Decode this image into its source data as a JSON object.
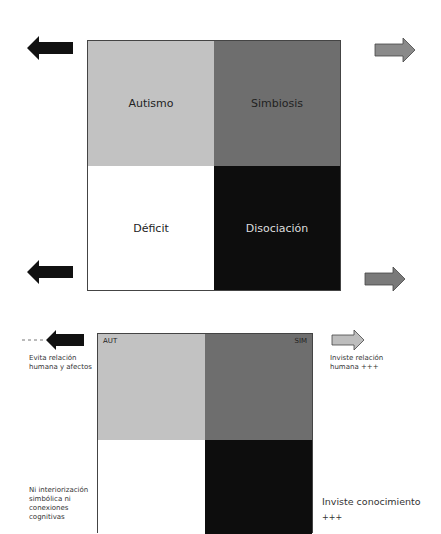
{
  "diagram_top": {
    "quadrants": [
      {
        "label": "Autismo",
        "color": "#c2c2c2"
      },
      {
        "label": "Simbiosis",
        "color": "#6e6e6e"
      },
      {
        "label": "Déficit",
        "color": "#ffffff"
      },
      {
        "label": "Disociación",
        "color": "#0d0d0d"
      }
    ],
    "arrows": {
      "top_left": {
        "direction": "left",
        "color": "#111111"
      },
      "top_right": {
        "direction": "right",
        "color": "#8a8a8a"
      },
      "bottom_left": {
        "direction": "left",
        "color": "#111111"
      },
      "bottom_right": {
        "direction": "right",
        "color": "#7a7a7a"
      }
    }
  },
  "diagram_bottom": {
    "corner_labels": {
      "top_left": "AUT",
      "top_right": "SIM"
    },
    "quadrant_colors": [
      "#c2c2c2",
      "#6e6e6e",
      "#ffffff",
      "#0d0d0d"
    ],
    "notes": {
      "left_top": [
        "Evita relación",
        "humana y afectos"
      ],
      "right_top": [
        "Inviste relación",
        "humana +++"
      ],
      "left_bottom": [
        "Ni interiorización",
        "simbólica ni",
        "conexiones",
        "cognitivas"
      ],
      "right_bottom": [
        "Inviste conocimiento",
        "+++"
      ]
    },
    "arrows": {
      "left": {
        "direction": "left",
        "color": "#111111",
        "dashed_tail": true
      },
      "right": {
        "direction": "right",
        "color": "#bdbdbd"
      }
    }
  }
}
